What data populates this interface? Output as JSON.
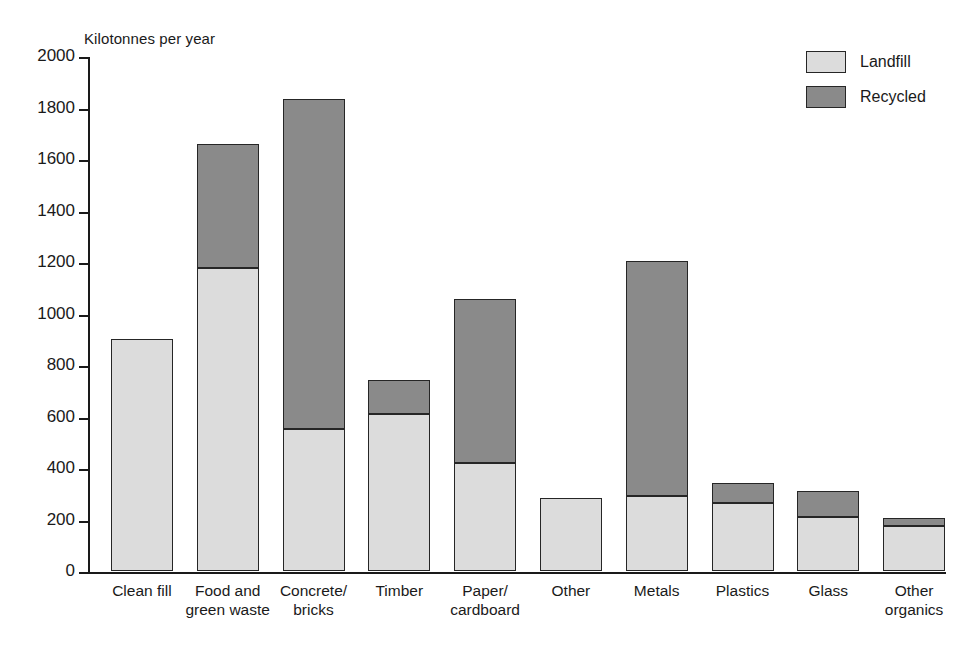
{
  "chart_data": {
    "type": "bar",
    "stacked": true,
    "title": "",
    "ylabel": "Kilotonnes per year",
    "xlabel": "",
    "ylim": [
      0,
      2000
    ],
    "yticks": [
      0,
      200,
      400,
      600,
      800,
      1000,
      1200,
      1400,
      1600,
      1800,
      2000
    ],
    "ytick_labels": [
      "0",
      "200",
      "400",
      "600",
      "800",
      "1000",
      "1200",
      "1400",
      "1600",
      "1800",
      "2000"
    ],
    "grid": false,
    "legend_position": "top-right",
    "categories": [
      "Clean fill",
      "Food and\ngreen waste",
      "Concrete/\nbricks",
      "Timber",
      "Paper/\ncardboard",
      "Other",
      "Metals",
      "Plastics",
      "Glass",
      "Other\norganics"
    ],
    "series": [
      {
        "name": "Landfill",
        "color": "#dcdcdc",
        "values": [
          900,
          1175,
          550,
          610,
          420,
          285,
          290,
          265,
          210,
          175
        ]
      },
      {
        "name": "Recycled",
        "color": "#8a8a8a",
        "values": [
          0,
          485,
          1285,
          130,
          635,
          0,
          915,
          75,
          100,
          30
        ]
      }
    ],
    "totals": [
      900,
      1660,
      1835,
      740,
      1055,
      285,
      1205,
      340,
      310,
      205
    ]
  },
  "legend": {
    "items": [
      {
        "label": "Landfill",
        "swatch": "landfill-swatch"
      },
      {
        "label": "Recycled",
        "swatch": "recycled-swatch"
      }
    ]
  }
}
